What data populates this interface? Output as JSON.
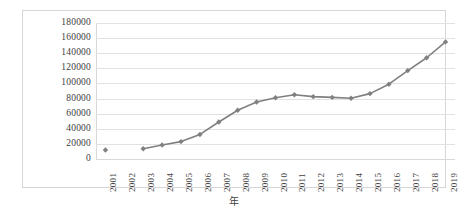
{
  "chart_data": {
    "type": "line",
    "title": "",
    "xlabel": "年",
    "ylabel": "",
    "ylim": [
      0,
      180000
    ],
    "ystep": 20000,
    "grid": true,
    "legend": false,
    "series_color": "#808080",
    "marker": "diamond",
    "categories": [
      "2001",
      "2002",
      "2003",
      "2004",
      "2005",
      "2006",
      "2007",
      "2008",
      "2009",
      "2010",
      "2011",
      "2012",
      "2013",
      "2014",
      "2015",
      "2016",
      "2017",
      "2018",
      "2019"
    ],
    "values": [
      12000,
      null,
      13500,
      18500,
      23000,
      32500,
      49000,
      64500,
      75500,
      81000,
      85000,
      82500,
      81500,
      80500,
      86500,
      99000,
      117000,
      134000,
      155000
    ],
    "ytick_labels": [
      "180000",
      "160000",
      "140000",
      "120000",
      "100000",
      "80000",
      "60000",
      "40000",
      "20000",
      "0"
    ],
    "ytick_values": [
      180000,
      160000,
      140000,
      120000,
      100000,
      80000,
      60000,
      40000,
      20000,
      0
    ]
  }
}
